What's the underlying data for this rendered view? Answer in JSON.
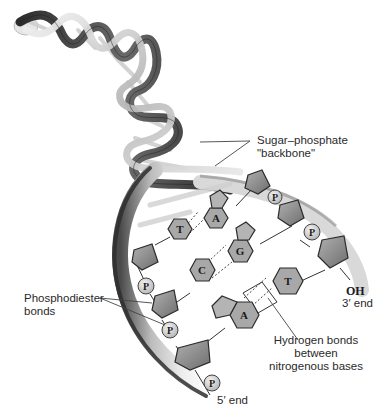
{
  "diagram": {
    "labels": {
      "backbone_line1": "Sugar–phosphate",
      "backbone_line2": "\"backbone\"",
      "phosphodiester_line1": "Phosphodiester",
      "phosphodiester_line2": "bonds",
      "hydrogen_line1": "Hydrogen bonds",
      "hydrogen_line2": "between",
      "hydrogen_line3": "nitrogenous bases",
      "three_prime_oh": "OH",
      "three_prime_end": "3′ end",
      "five_prime_end": "5′ end"
    },
    "bases": {
      "pair1_left": "T",
      "pair1_right": "A",
      "pair2_left": "C",
      "pair2_right": "G",
      "pair3_left": "A",
      "pair3_right": "T"
    },
    "phosphate_symbol": "P",
    "colors": {
      "background": "#ffffff",
      "helix_dark": "#3a3a3a",
      "helix_mid": "#8a8a8a",
      "helix_light": "#d8d8d8",
      "sugar_fill": "#8c8c8c",
      "base_fill": "#a8a8a8",
      "phosphate_fill": "#dcdcdc",
      "text": "#2a2a2a"
    }
  }
}
